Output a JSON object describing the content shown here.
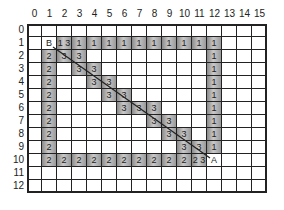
{
  "grid": {
    "columns": 16,
    "rows": 13,
    "column_labels": [
      "0",
      "1",
      "2",
      "3",
      "4",
      "5",
      "6",
      "7",
      "8",
      "9",
      "10",
      "11",
      "12",
      "13",
      "14",
      "15"
    ],
    "row_labels": [
      "0",
      "1",
      "2",
      "3",
      "4",
      "5",
      "6",
      "7",
      "8",
      "9",
      "10",
      "11",
      "12"
    ],
    "shade_color": "#a8a8a8",
    "line_color": "#222222"
  },
  "cells": [
    {
      "r": 1,
      "c": 1,
      "text": "B",
      "shade": false
    },
    {
      "r": 1,
      "c": 2,
      "text": "1 3",
      "shade": true
    },
    {
      "r": 1,
      "c": 3,
      "text": "1",
      "shade": true
    },
    {
      "r": 1,
      "c": 4,
      "text": "1",
      "shade": true
    },
    {
      "r": 1,
      "c": 5,
      "text": "1",
      "shade": true
    },
    {
      "r": 1,
      "c": 6,
      "text": "1",
      "shade": true
    },
    {
      "r": 1,
      "c": 7,
      "text": "1",
      "shade": true
    },
    {
      "r": 1,
      "c": 8,
      "text": "1",
      "shade": true
    },
    {
      "r": 1,
      "c": 9,
      "text": "1",
      "shade": true
    },
    {
      "r": 1,
      "c": 10,
      "text": "1",
      "shade": true
    },
    {
      "r": 1,
      "c": 11,
      "text": "1",
      "shade": true
    },
    {
      "r": 1,
      "c": 12,
      "text": "1",
      "shade": true
    },
    {
      "r": 2,
      "c": 1,
      "text": "2",
      "shade": true
    },
    {
      "r": 2,
      "c": 2,
      "text": "3",
      "shade": true
    },
    {
      "r": 2,
      "c": 3,
      "text": "3",
      "shade": true
    },
    {
      "r": 2,
      "c": 12,
      "text": "1",
      "shade": true
    },
    {
      "r": 3,
      "c": 1,
      "text": "2",
      "shade": true
    },
    {
      "r": 3,
      "c": 3,
      "text": "3",
      "shade": true
    },
    {
      "r": 3,
      "c": 4,
      "text": "3",
      "shade": true
    },
    {
      "r": 3,
      "c": 12,
      "text": "1",
      "shade": true
    },
    {
      "r": 4,
      "c": 1,
      "text": "2",
      "shade": true
    },
    {
      "r": 4,
      "c": 4,
      "text": "3",
      "shade": true
    },
    {
      "r": 4,
      "c": 5,
      "text": "3",
      "shade": true
    },
    {
      "r": 4,
      "c": 12,
      "text": "1",
      "shade": true
    },
    {
      "r": 5,
      "c": 1,
      "text": "2",
      "shade": true
    },
    {
      "r": 5,
      "c": 5,
      "text": "3",
      "shade": true
    },
    {
      "r": 5,
      "c": 6,
      "text": "3",
      "shade": true
    },
    {
      "r": 5,
      "c": 12,
      "text": "1",
      "shade": true
    },
    {
      "r": 6,
      "c": 1,
      "text": "2",
      "shade": true
    },
    {
      "r": 6,
      "c": 6,
      "text": "3",
      "shade": true
    },
    {
      "r": 6,
      "c": 7,
      "text": "3",
      "shade": true
    },
    {
      "r": 6,
      "c": 8,
      "text": "3",
      "shade": true
    },
    {
      "r": 6,
      "c": 12,
      "text": "1",
      "shade": true
    },
    {
      "r": 7,
      "c": 1,
      "text": "2",
      "shade": true
    },
    {
      "r": 7,
      "c": 8,
      "text": "3",
      "shade": true
    },
    {
      "r": 7,
      "c": 9,
      "text": "3",
      "shade": true
    },
    {
      "r": 7,
      "c": 12,
      "text": "1",
      "shade": true
    },
    {
      "r": 8,
      "c": 1,
      "text": "2",
      "shade": true
    },
    {
      "r": 8,
      "c": 9,
      "text": "3",
      "shade": true
    },
    {
      "r": 8,
      "c": 10,
      "text": "3",
      "shade": true
    },
    {
      "r": 8,
      "c": 12,
      "text": "1",
      "shade": true
    },
    {
      "r": 9,
      "c": 1,
      "text": "2",
      "shade": true
    },
    {
      "r": 9,
      "c": 10,
      "text": "3",
      "shade": true
    },
    {
      "r": 9,
      "c": 11,
      "text": "3",
      "shade": true
    },
    {
      "r": 9,
      "c": 12,
      "text": "1",
      "shade": true
    },
    {
      "r": 10,
      "c": 1,
      "text": "2",
      "shade": true
    },
    {
      "r": 10,
      "c": 2,
      "text": "2",
      "shade": true
    },
    {
      "r": 10,
      "c": 3,
      "text": "2",
      "shade": true
    },
    {
      "r": 10,
      "c": 4,
      "text": "2",
      "shade": true
    },
    {
      "r": 10,
      "c": 5,
      "text": "2",
      "shade": true
    },
    {
      "r": 10,
      "c": 6,
      "text": "2",
      "shade": true
    },
    {
      "r": 10,
      "c": 7,
      "text": "2",
      "shade": true
    },
    {
      "r": 10,
      "c": 8,
      "text": "2",
      "shade": true
    },
    {
      "r": 10,
      "c": 9,
      "text": "2",
      "shade": true
    },
    {
      "r": 10,
      "c": 10,
      "text": "2",
      "shade": true
    },
    {
      "r": 10,
      "c": 11,
      "text": "2 3",
      "shade": true
    },
    {
      "r": 10,
      "c": 12,
      "text": "A",
      "shade": false
    }
  ],
  "path_line": {
    "from_label": "B",
    "to_label": "A",
    "from": {
      "r": 1,
      "c": 1
    },
    "to": {
      "r": 10,
      "c": 12
    }
  }
}
